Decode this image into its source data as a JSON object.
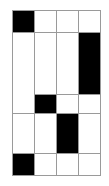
{
  "diagram": {
    "type": "grid-layout",
    "fill_color": "#000000",
    "empty_color": "#ffffff",
    "line_color": "#9a9a9a",
    "cells": [
      {
        "id": "r1c1",
        "x": 12,
        "y": 10,
        "w": 23,
        "h": 23,
        "filled": true
      },
      {
        "id": "r1c2",
        "x": 34,
        "y": 10,
        "w": 23,
        "h": 23,
        "filled": false
      },
      {
        "id": "r1c3",
        "x": 56,
        "y": 10,
        "w": 23,
        "h": 23,
        "filled": false
      },
      {
        "id": "r1c4",
        "x": 78,
        "y": 10,
        "w": 23,
        "h": 23,
        "filled": false
      },
      {
        "id": "r2c1",
        "x": 12,
        "y": 32,
        "w": 23,
        "h": 82,
        "filled": false
      },
      {
        "id": "r2c2",
        "x": 34,
        "y": 32,
        "w": 23,
        "h": 63,
        "filled": false
      },
      {
        "id": "r2c3",
        "x": 56,
        "y": 32,
        "w": 23,
        "h": 63,
        "filled": false
      },
      {
        "id": "r2c4",
        "x": 78,
        "y": 32,
        "w": 23,
        "h": 63,
        "filled": true
      },
      {
        "id": "r3c2",
        "x": 34,
        "y": 94,
        "w": 23,
        "h": 20,
        "filled": true
      },
      {
        "id": "r3c3",
        "x": 56,
        "y": 94,
        "w": 23,
        "h": 20,
        "filled": false
      },
      {
        "id": "r3c4",
        "x": 78,
        "y": 94,
        "w": 23,
        "h": 20,
        "filled": false
      },
      {
        "id": "r4c1",
        "x": 12,
        "y": 113,
        "w": 23,
        "h": 41,
        "filled": false
      },
      {
        "id": "r4c2",
        "x": 34,
        "y": 113,
        "w": 23,
        "h": 41,
        "filled": false
      },
      {
        "id": "r4c3",
        "x": 56,
        "y": 113,
        "w": 23,
        "h": 41,
        "filled": true
      },
      {
        "id": "r4c4",
        "x": 78,
        "y": 113,
        "w": 23,
        "h": 41,
        "filled": false
      },
      {
        "id": "r5c1",
        "x": 12,
        "y": 153,
        "w": 23,
        "h": 23,
        "filled": true
      },
      {
        "id": "r5c2",
        "x": 34,
        "y": 153,
        "w": 23,
        "h": 23,
        "filled": false
      },
      {
        "id": "r5c3",
        "x": 56,
        "y": 153,
        "w": 23,
        "h": 23,
        "filled": false
      },
      {
        "id": "r5c4",
        "x": 78,
        "y": 153,
        "w": 23,
        "h": 23,
        "filled": false
      }
    ]
  }
}
